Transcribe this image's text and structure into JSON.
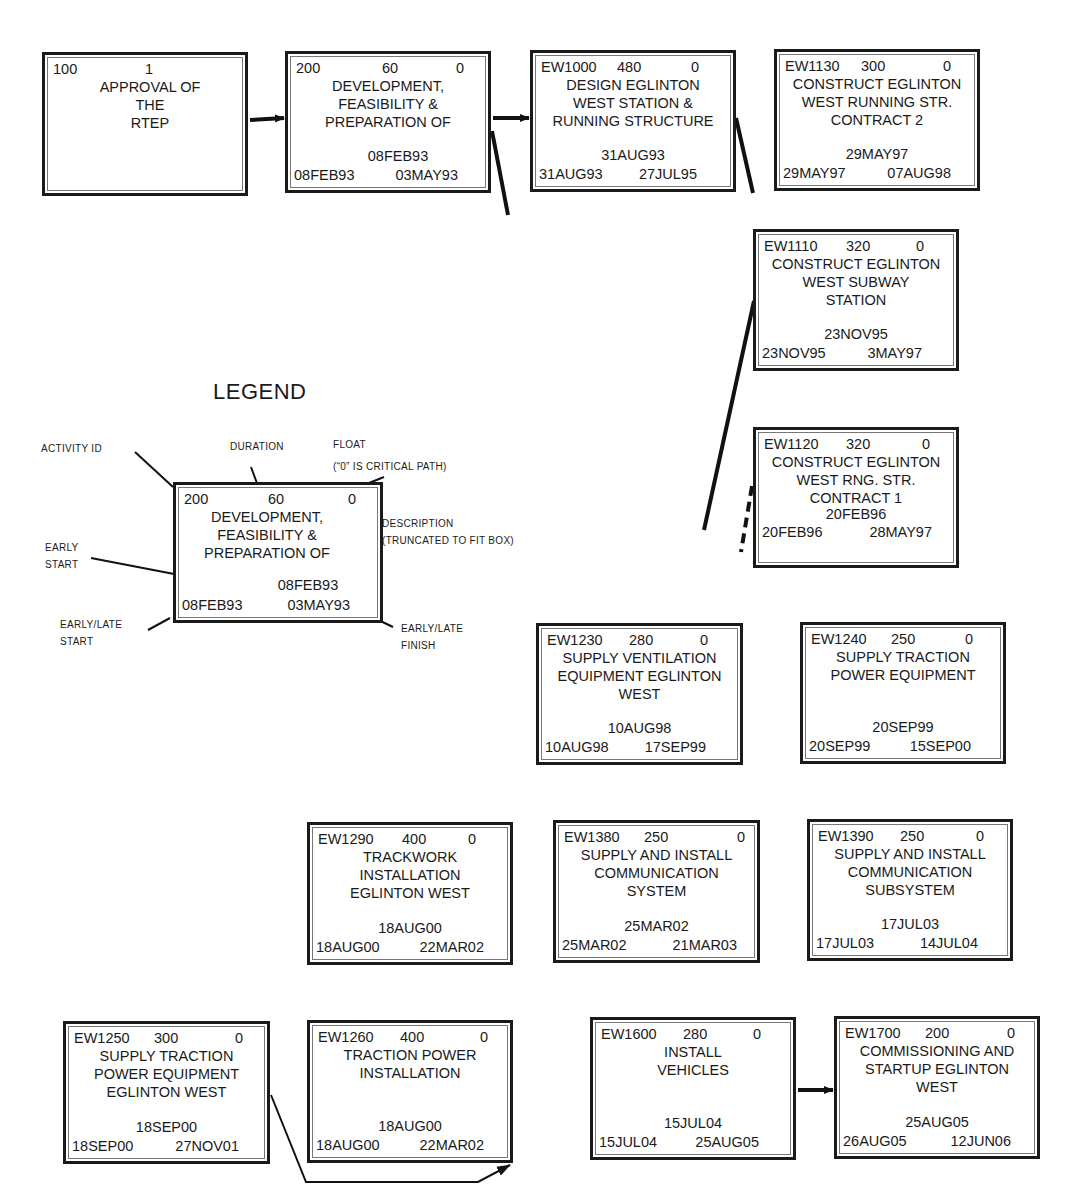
{
  "diagram": {
    "type": "precedence network (critical path schedule)",
    "legend": {
      "title": "LEGEND",
      "sample_node": {
        "id": "200",
        "duration": "60",
        "float": "0",
        "description": "DEVELOPMENT,\nFEASIBILITY &\nPREPARATION OF",
        "early_start": "08FEB93",
        "early_late_start": "08FEB93",
        "early_late_finish": "03MAY93"
      },
      "callouts": {
        "activity_id": "ACTIVITY ID",
        "duration": "DURATION",
        "float": "FLOAT\n(“0” IS CRITICAL PATH)",
        "description": "DESCRIPTION\n(TRUNCATED TO FIT BOX)",
        "early_start": "EARLY\nSTART",
        "early_late_start": "EARLY/LATE\nSTART",
        "early_late_finish": "EARLY/LATE\nFINISH"
      }
    },
    "nodes": [
      {
        "id": "100",
        "duration": "1",
        "float": "",
        "description": "APPROVAL OF\nTHE\nRTEP",
        "early_start": "",
        "start": "",
        "finish": "",
        "crossed_out": true
      },
      {
        "id": "200",
        "duration": "60",
        "float": "0",
        "description": "DEVELOPMENT,\nFEASIBILITY &\nPREPARATION OF",
        "early_start": "08FEB93",
        "start": "08FEB93",
        "finish": "03MAY93"
      },
      {
        "id": "EW1000",
        "duration": "480",
        "float": "0",
        "description": "DESIGN EGLINTON\nWEST STATION &\nRUNNING STRUCTURE",
        "early_start": "31AUG93",
        "start": "31AUG93",
        "finish": "27JUL95"
      },
      {
        "id": "EW1130",
        "duration": "300",
        "float": "0",
        "description": "CONSTRUCT EGLINTON\nWEST RUNNING STR.\nCONTRACT 2",
        "early_start": "29MAY97",
        "start": "29MAY97",
        "finish": "07AUG98"
      },
      {
        "id": "EW1110",
        "duration": "320",
        "float": "0",
        "description": "CONSTRUCT EGLINTON\nWEST SUBWAY\nSTATION",
        "early_start": "23NOV95",
        "start": "23NOV95",
        "finish": "3MAY97"
      },
      {
        "id": "EW1120",
        "duration": "320",
        "float": "0",
        "description": "CONSTRUCT EGLINTON\nWEST RNG. STR.\nCONTRACT 1",
        "early_start": "20FEB96",
        "start": "20FEB96",
        "finish": "28MAY97"
      },
      {
        "id": "EW1230",
        "duration": "280",
        "float": "0",
        "description": "SUPPLY VENTILATION\nEQUIPMENT EGLINTON\nWEST",
        "early_start": "10AUG98",
        "start": "10AUG98",
        "finish": "17SEP99"
      },
      {
        "id": "EW1240",
        "duration": "250",
        "float": "0",
        "description": "SUPPLY TRACTION\nPOWER EQUIPMENT",
        "early_start": "20SEP99",
        "start": "20SEP99",
        "finish": "15SEP00"
      },
      {
        "id": "EW1290",
        "duration": "400",
        "float": "0",
        "description": "TRACKWORK\nINSTALLATION\nEGLINTON WEST",
        "early_start": "18AUG00",
        "start": "18AUG00",
        "finish": "22MAR02"
      },
      {
        "id": "EW1380",
        "duration": "250",
        "float": "0",
        "description": "SUPPLY AND INSTALL\nCOMMUNICATION\nSYSTEM",
        "early_start": "25MAR02",
        "start": "25MAR02",
        "finish": "21MAR03"
      },
      {
        "id": "EW1390",
        "duration": "250",
        "float": "0",
        "description": "SUPPLY AND INSTALL\nCOMMUNICATION\nSUBSYSTEM",
        "early_start": "17JUL03",
        "start": "17JUL03",
        "finish": "14JUL04"
      },
      {
        "id": "EW1250",
        "duration": "300",
        "float": "0",
        "description": "SUPPLY TRACTION\nPOWER EQUIPMENT\nEGLINTON WEST",
        "early_start": "18SEP00",
        "start": "18SEP00",
        "finish": "27NOV01"
      },
      {
        "id": "EW1260",
        "duration": "400",
        "float": "0",
        "description": "TRACTION POWER\nINSTALLATION",
        "early_start": "18AUG00",
        "start": "18AUG00",
        "finish": "22MAR02"
      },
      {
        "id": "EW1600",
        "duration": "280",
        "float": "0",
        "description": "INSTALL\nVEHICLES",
        "early_start": "15JUL04",
        "start": "15JUL04",
        "finish": "25AUG05"
      },
      {
        "id": "EW1700",
        "duration": "200",
        "float": "0",
        "description": "COMMISSIONING AND\nSTARTUP EGLINTON\nWEST",
        "early_start": "25AUG05",
        "start": "26AUG05",
        "finish": "12JUN06"
      }
    ],
    "edges": [
      {
        "from": "100",
        "to": "200"
      },
      {
        "from": "200",
        "to": "EW1000"
      },
      {
        "from": "EW1250",
        "to": "EW1260"
      },
      {
        "from": "EW1600",
        "to": "EW1700"
      }
    ]
  }
}
